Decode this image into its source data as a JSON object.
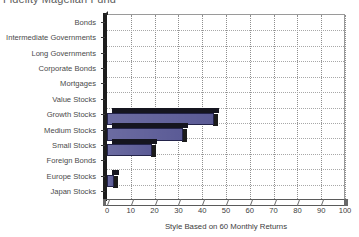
{
  "chart_data": {
    "type": "bar",
    "orientation": "horizontal",
    "title": "Fidelity Magellan Fund",
    "xlabel": "Style Based on 60 Monthly Returns",
    "ylabel": "",
    "xlim": [
      0,
      100
    ],
    "xticks": [
      0,
      10,
      20,
      30,
      40,
      50,
      60,
      70,
      80,
      90,
      100
    ],
    "grid": "both-dotted",
    "legend": "none",
    "series_color": "#5b5b96",
    "categories": [
      "Bonds",
      "Intermediate Governments",
      "Long Governments",
      "Corporate Bonds",
      "Mortgages",
      "Value Stocks",
      "Growth Stocks",
      "Medium Stocks",
      "Small Stocks",
      "Foreign Bonds",
      "Europe Stocks",
      "Japan Stocks"
    ],
    "values": [
      0,
      0,
      0,
      0,
      0,
      0,
      45,
      32,
      19,
      0,
      3,
      0
    ],
    "series": [
      {
        "name": "Style Weight",
        "values": [
          0,
          0,
          0,
          0,
          0,
          0,
          45,
          32,
          19,
          0,
          3,
          0
        ]
      }
    ]
  },
  "axis": {
    "x_tick_labels": [
      "0",
      "10",
      "20",
      "30",
      "40",
      "50",
      "60",
      "70",
      "80",
      "90",
      "100"
    ],
    "x_title": "Style Based on 60 Monthly Returns"
  },
  "colors": {
    "bar_face": "#5b5b96",
    "bar_shadow": "#1b1b1b",
    "bar_edge": "#23234a",
    "grid": "#8e8e8e",
    "axis": "#5a5a5a",
    "text": "#3d3d3d",
    "title_text": "#5c5c5c"
  }
}
